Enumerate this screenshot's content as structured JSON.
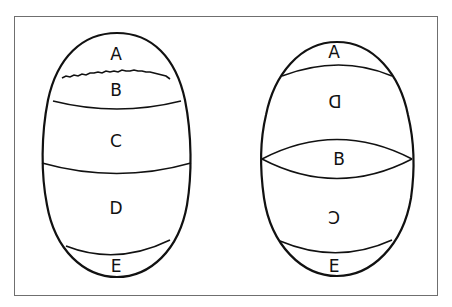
{
  "figure": {
    "frame_color": "#6f6f6f",
    "line_color": "#111111",
    "background": "#ffffff"
  },
  "left_egg": {
    "description": "egg with regions stacked top to bottom",
    "regions": [
      {
        "label": "A",
        "mirrored": false
      },
      {
        "label": "B",
        "mirrored": false
      },
      {
        "label": "C",
        "mirrored": false
      },
      {
        "label": "D",
        "mirrored": false
      },
      {
        "label": "E",
        "mirrored": false
      }
    ]
  },
  "right_egg": {
    "description": "egg with regions stacked top to bottom, some labels mirrored",
    "regions": [
      {
        "label": "A",
        "mirrored": false
      },
      {
        "label": "D",
        "mirrored": true
      },
      {
        "label": "B",
        "mirrored": false
      },
      {
        "label": "C",
        "mirrored": true
      },
      {
        "label": "E",
        "mirrored": false
      }
    ]
  }
}
